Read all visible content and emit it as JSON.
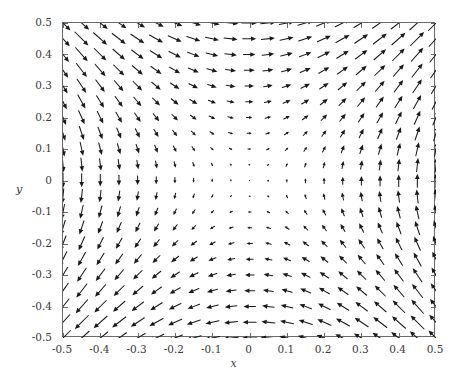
{
  "chart_data": {
    "type": "quiver",
    "title": "",
    "xlabel": "x",
    "ylabel": "y",
    "xlim": [
      -0.5,
      0.5
    ],
    "ylim": [
      -0.5,
      0.5
    ],
    "xticks": [
      "-0.5",
      "-0.4",
      "-0.3",
      "-0.2",
      "-0.1",
      "0",
      "0.1",
      "0.2",
      "0.3",
      "0.4",
      "0.5"
    ],
    "yticks": [
      "0.5",
      "0.4",
      "0.3",
      "0.2",
      "0.1",
      "0",
      "-0.1",
      "-0.2",
      "-0.3",
      "-0.4",
      "-0.5"
    ],
    "xtick_values": [
      -0.5,
      -0.4,
      -0.3,
      -0.2,
      -0.1,
      0,
      0.1,
      0.2,
      0.3,
      0.4,
      0.5
    ],
    "ytick_values": [
      0.5,
      0.4,
      0.3,
      0.2,
      0.1,
      0,
      -0.1,
      -0.2,
      -0.3,
      -0.4,
      -0.5
    ],
    "grid": false,
    "legend": false,
    "field": {
      "description": "Hyperbolic saddle vector field. Horizontal component proportional to y, vertical component proportional to x.",
      "u_formula": "y",
      "v_formula": "x",
      "grid_nx": 21,
      "grid_ny": 21,
      "x_start": -0.5,
      "x_end": 0.5,
      "y_start": -0.5,
      "y_end": 0.5,
      "arrow_scale": 30.0,
      "max_arrow_px": 24.0,
      "head_length_px": 5.2,
      "head_half_width_px": 2.3,
      "stagnation_point": [
        0,
        0
      ],
      "quadrant_directions": {
        "upper_left": "down-right",
        "upper_right": "up-right",
        "lower_left": "down-left",
        "lower_right": "up-left"
      },
      "edge_directions": {
        "top_center": "right",
        "bottom_center": "left",
        "left_center": "down",
        "right_center": "up"
      }
    },
    "colors": {
      "arrow": "#1a1a1a",
      "frame": "#6b6b6b",
      "tick_label": "#3a3a3a",
      "background": "#ffffff"
    }
  },
  "plot": {
    "frame": {
      "left_px": 62,
      "top_px": 22,
      "width_px": 373,
      "height_px": 315
    },
    "tick_length_px": 5
  }
}
